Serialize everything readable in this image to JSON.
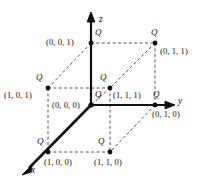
{
  "figure": {
    "colors": {
      "axis": "#111111",
      "dashed": "#555555",
      "text": "#111111",
      "background": "#ffffff"
    },
    "axes": [
      {
        "name": "z-axis",
        "label": "z"
      },
      {
        "name": "y-axis",
        "label": "y"
      },
      {
        "name": "x-axis",
        "label": "x"
      }
    ],
    "charge_symbol": "Q",
    "vertices": [
      {
        "id": "origin",
        "coord": "(0, 0, 0)",
        "charge": "Q"
      },
      {
        "id": "z",
        "coord": "(0, 0, 1)",
        "charge": "Q"
      },
      {
        "id": "yz",
        "coord": "(0, 1, 1)",
        "charge": "Q"
      },
      {
        "id": "y",
        "coord": "(0, 1, 0)",
        "charge": "Q"
      },
      {
        "id": "xz",
        "coord": "(1, 0, 1)",
        "charge": "Q"
      },
      {
        "id": "xyz",
        "coord": "(1, 1, 1)",
        "charge": "Q"
      },
      {
        "id": "x",
        "coord": "(1, 0, 0)",
        "charge": "Q"
      },
      {
        "id": "xy",
        "coord": "(1, 1, 0)",
        "charge": "Q"
      }
    ]
  }
}
